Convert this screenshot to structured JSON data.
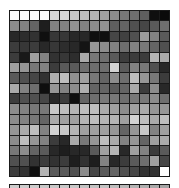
{
  "puzzle": {
    "type": "sliding-tile-grayscale",
    "rows": 16,
    "cols": 16,
    "empty_cell": {
      "row": 15,
      "col": 15
    },
    "grid": [
      [
        250,
        250,
        250,
        250,
        215,
        215,
        200,
        190,
        180,
        160,
        140,
        120,
        110,
        95,
        15,
        10
      ],
      [
        140,
        130,
        100,
        30,
        130,
        130,
        145,
        130,
        140,
        145,
        95,
        100,
        80,
        70,
        90,
        110
      ],
      [
        40,
        45,
        50,
        15,
        55,
        55,
        40,
        40,
        15,
        15,
        70,
        65,
        80,
        155,
        130,
        90
      ],
      [
        60,
        55,
        60,
        40,
        55,
        45,
        40,
        20,
        150,
        140,
        130,
        110,
        130,
        120,
        100,
        80
      ],
      [
        60,
        25,
        160,
        130,
        50,
        55,
        45,
        170,
        120,
        110,
        90,
        60,
        60,
        60,
        180,
        170
      ],
      [
        160,
        150,
        120,
        130,
        60,
        90,
        90,
        110,
        110,
        110,
        210,
        90,
        130,
        120,
        80,
        40
      ],
      [
        90,
        80,
        70,
        50,
        175,
        190,
        145,
        160,
        120,
        100,
        140,
        110,
        190,
        150,
        120,
        60
      ],
      [
        170,
        130,
        110,
        15,
        150,
        130,
        140,
        175,
        100,
        100,
        90,
        100,
        170,
        60,
        140,
        40
      ],
      [
        60,
        80,
        80,
        70,
        40,
        60,
        15,
        100,
        110,
        120,
        120,
        110,
        120,
        120,
        140,
        110
      ],
      [
        140,
        130,
        120,
        120,
        200,
        190,
        180,
        190,
        190,
        170,
        160,
        140,
        160,
        170,
        150,
        150
      ],
      [
        140,
        130,
        120,
        100,
        170,
        160,
        160,
        180,
        190,
        180,
        180,
        160,
        210,
        190,
        170,
        190
      ],
      [
        150,
        170,
        190,
        130,
        210,
        200,
        180,
        160,
        160,
        160,
        150,
        100,
        150,
        200,
        130,
        160
      ],
      [
        140,
        190,
        150,
        130,
        60,
        40,
        170,
        120,
        150,
        190,
        170,
        130,
        150,
        100,
        160,
        170
      ],
      [
        120,
        140,
        100,
        90,
        40,
        30,
        40,
        40,
        90,
        160,
        180,
        40,
        160,
        130,
        60,
        90
      ],
      [
        80,
        80,
        50,
        60,
        50,
        60,
        30,
        50,
        30,
        130,
        40,
        60,
        90,
        110,
        160,
        70
      ],
      [
        60,
        50,
        15,
        180,
        90,
        90,
        80,
        140,
        70,
        90,
        100,
        80,
        70,
        50,
        50,
        null
      ]
    ],
    "second_board_strip": [
      205,
      205,
      205,
      200,
      200,
      200,
      200,
      195,
      195,
      195,
      190,
      185,
      180,
      175,
      170,
      165
    ]
  }
}
